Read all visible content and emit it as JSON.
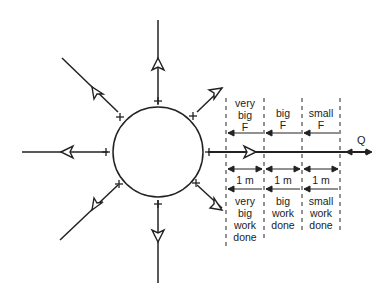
{
  "diagram": {
    "charge_sign": "+",
    "test_charge_label": "Q",
    "force_labels": [
      [
        "very",
        "big",
        "F"
      ],
      [
        "big",
        "F"
      ],
      [
        "small",
        "F"
      ]
    ],
    "distance_labels": [
      "1 m",
      "1 m",
      "1 m"
    ],
    "work_labels": [
      [
        "very",
        "big",
        "work",
        "done"
      ],
      [
        "big",
        "work",
        "done"
      ],
      [
        "small",
        "work",
        "done"
      ]
    ],
    "colors": {
      "line": "#222222",
      "background": "#ffffff"
    }
  }
}
